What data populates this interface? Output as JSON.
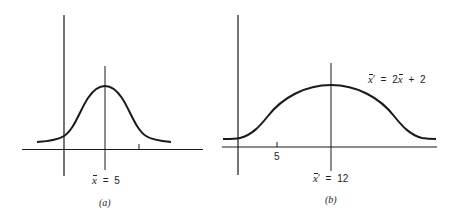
{
  "panels": [
    {
      "id": "a",
      "caption": "(a)",
      "mean_label": {
        "var": "x",
        "prime": "",
        "eq": "=",
        "value": "5"
      },
      "tick_label": ""
    },
    {
      "id": "b",
      "caption": "(b)",
      "mean_label": {
        "var": "x",
        "prime": "′",
        "eq": "=",
        "value": "12"
      },
      "tick_label": "5",
      "transform_label": {
        "lhs_var": "x",
        "lhs_prime": "′",
        "eq": "=",
        "coef": "2",
        "rhs_var": "x",
        "plus": "+",
        "const": "2"
      }
    }
  ],
  "colors": {
    "line": "#1a1a1a",
    "background": "#ffffff"
  }
}
